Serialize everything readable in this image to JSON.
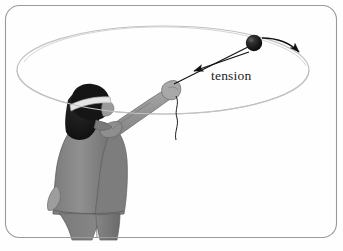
{
  "figure": {
    "caption_label": "tension",
    "border": {
      "style": "rounded-rectangle",
      "color": "#9a9a9a",
      "corner_radius": 14
    },
    "background_color": "#fefefe"
  },
  "labels": {
    "tension": "tension"
  },
  "colors": {
    "line": "#111111",
    "circle_path": "#b9b9b9",
    "ball": "#1a1a1a",
    "hair": "#141414",
    "headband": "#e8e8e8",
    "jacket": "#8b8b8b",
    "jacket_shadow": "#6f6f6f",
    "sleeve": "#9a9a9a",
    "pants": "#7e7e7e",
    "skin": "#b5b5b5",
    "border": "#9a9a9a",
    "background": "#fefefe"
  },
  "elements": {
    "circular_path_name": "circular trajectory ellipse",
    "ball_name": "ball",
    "string_name": "string",
    "tension_arrow_name": "tension force arrow",
    "velocity_arrow_name": "velocity arrow",
    "person_name": "person swinging the ball",
    "loose_string_name": "loose string end"
  },
  "geometry": {
    "ball_center": [
      254,
      43
    ],
    "ball_radius": 8,
    "hand_point": [
      172,
      83
    ],
    "ellipse_center": [
      163,
      70
    ],
    "ellipse_rx": 146,
    "ellipse_ry": 44
  }
}
